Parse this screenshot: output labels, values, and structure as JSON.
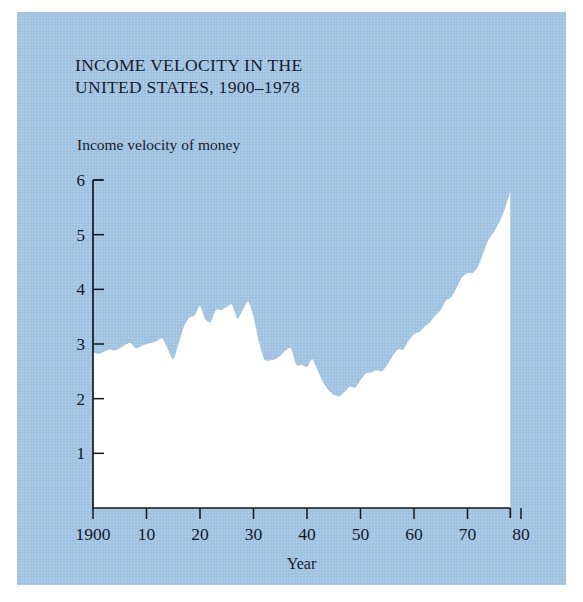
{
  "figure": {
    "panel_color": "#a5c8e8",
    "area_fill": "#ffffff",
    "axis_color": "#16181f",
    "title_line1": "INCOME VELOCITY IN THE",
    "title_line2": "UNITED STATES, 1900–1978",
    "y_axis_caption": "Income velocity of money",
    "x_axis_title": "Year"
  },
  "chart_data": {
    "type": "area",
    "xlabel": "Year",
    "ylabel": "Income velocity of money",
    "xlim": [
      1900,
      1980
    ],
    "ylim": [
      0,
      6
    ],
    "grid": false,
    "legend": "none",
    "x_tick_labels": [
      "1900",
      "10",
      "20",
      "30",
      "40",
      "50",
      "60",
      "70",
      "80"
    ],
    "x_tick_values": [
      1900,
      1910,
      1920,
      1930,
      1940,
      1950,
      1960,
      1970,
      1980
    ],
    "y_tick_labels": [
      "1",
      "2",
      "3",
      "4",
      "5",
      "6"
    ],
    "y_tick_values": [
      1,
      2,
      3,
      4,
      5,
      6
    ],
    "series_name": "Income velocity of money",
    "x": [
      1900,
      1901,
      1902,
      1903,
      1904,
      1905,
      1906,
      1907,
      1908,
      1909,
      1910,
      1911,
      1912,
      1913,
      1914,
      1915,
      1916,
      1917,
      1918,
      1919,
      1920,
      1921,
      1922,
      1923,
      1924,
      1925,
      1926,
      1927,
      1928,
      1929,
      1930,
      1931,
      1932,
      1933,
      1934,
      1935,
      1936,
      1937,
      1938,
      1939,
      1940,
      1941,
      1942,
      1943,
      1944,
      1945,
      1946,
      1947,
      1948,
      1949,
      1950,
      1951,
      1952,
      1953,
      1954,
      1955,
      1956,
      1957,
      1958,
      1959,
      1960,
      1961,
      1962,
      1963,
      1964,
      1965,
      1966,
      1967,
      1968,
      1969,
      1970,
      1971,
      1972,
      1973,
      1974,
      1975,
      1976,
      1977,
      1978
    ],
    "values": [
      2.85,
      2.82,
      2.86,
      2.9,
      2.88,
      2.92,
      2.98,
      3.02,
      2.92,
      2.96,
      3.0,
      3.02,
      3.06,
      3.1,
      2.9,
      2.72,
      3.0,
      3.32,
      3.48,
      3.52,
      3.7,
      3.45,
      3.4,
      3.62,
      3.62,
      3.68,
      3.72,
      3.46,
      3.62,
      3.78,
      3.5,
      3.05,
      2.72,
      2.7,
      2.72,
      2.78,
      2.88,
      2.92,
      2.62,
      2.62,
      2.58,
      2.72,
      2.52,
      2.3,
      2.16,
      2.07,
      2.04,
      2.12,
      2.22,
      2.2,
      2.34,
      2.46,
      2.48,
      2.52,
      2.5,
      2.62,
      2.78,
      2.9,
      2.9,
      3.06,
      3.18,
      3.22,
      3.32,
      3.4,
      3.52,
      3.62,
      3.8,
      3.86,
      4.04,
      4.22,
      4.3,
      4.3,
      4.42,
      4.68,
      4.92,
      5.06,
      5.24,
      5.48,
      5.78
    ],
    "notes": {
      "start_value": 2.85,
      "minimum": {
        "year": 1946,
        "value": 2.04
      },
      "maximum": {
        "year": 1978,
        "value": 5.78
      },
      "interwar_peak": {
        "year": 1929,
        "value": 3.78
      },
      "wwi_dip": {
        "year": 1915,
        "value": 2.72
      }
    }
  }
}
